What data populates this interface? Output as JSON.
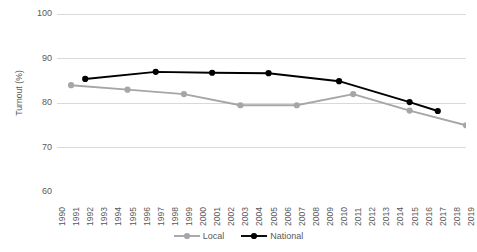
{
  "chart_data": {
    "type": "line",
    "title": "",
    "xlabel": "",
    "ylabel": "Turnout (%)",
    "ylim": [
      60,
      100
    ],
    "yticks": [
      100,
      90,
      80,
      70,
      60
    ],
    "grid": true,
    "legend_position": "bottom-center",
    "x": [
      1990,
      1991,
      1992,
      1993,
      1994,
      1995,
      1996,
      1997,
      1998,
      1999,
      2000,
      2001,
      2002,
      2003,
      2004,
      2005,
      2006,
      2007,
      2008,
      2009,
      2010,
      2011,
      2012,
      2013,
      2014,
      2015,
      2016,
      2017,
      2018,
      2019
    ],
    "xtick_labels": [
      "1990",
      "1991",
      "1992",
      "1993",
      "1994",
      "1995",
      "1996",
      "1997",
      "1998",
      "1999",
      "2000",
      "2001",
      "2002",
      "2003",
      "2004",
      "2005",
      "2006",
      "2007",
      "2008",
      "2009",
      "2010",
      "2011",
      "2012",
      "2013",
      "2014",
      "2015",
      "2016",
      "2017",
      "2018",
      "2019"
    ],
    "series": [
      {
        "name": "Local",
        "color": "#A6A6A6",
        "points": [
          {
            "x": 1991,
            "y": 84.0
          },
          {
            "x": 1995,
            "y": 83.0
          },
          {
            "x": 1999,
            "y": 82.0
          },
          {
            "x": 2003,
            "y": 79.5
          },
          {
            "x": 2007,
            "y": 79.5
          },
          {
            "x": 2011,
            "y": 82.0
          },
          {
            "x": 2015,
            "y": 78.3
          },
          {
            "x": 2019,
            "y": 75.0
          }
        ]
      },
      {
        "name": "National",
        "color": "#000000",
        "points": [
          {
            "x": 1992,
            "y": 85.4
          },
          {
            "x": 1997,
            "y": 87.0
          },
          {
            "x": 2001,
            "y": 86.8
          },
          {
            "x": 2005,
            "y": 86.7
          },
          {
            "x": 2010,
            "y": 84.9
          },
          {
            "x": 2015,
            "y": 80.2
          },
          {
            "x": 2017,
            "y": 78.2
          }
        ]
      }
    ]
  },
  "legend": {
    "items": [
      {
        "label": "Local",
        "color": "#A6A6A6"
      },
      {
        "label": "National",
        "color": "#000000"
      }
    ]
  }
}
